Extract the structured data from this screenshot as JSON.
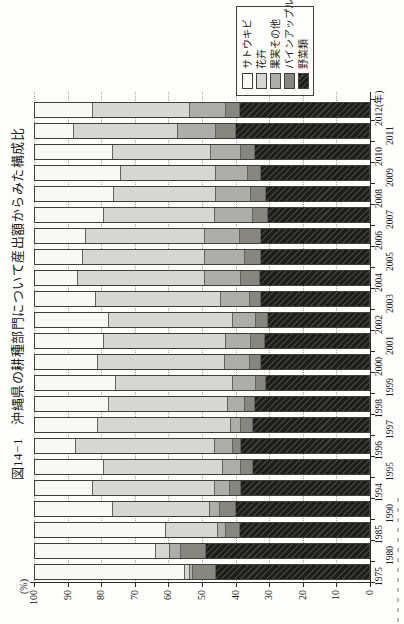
{
  "title": "図14−1　沖縄県の耕種部門について産出額からみた構成比",
  "axis": {
    "unit_label": "(%)",
    "y_ticks": [
      100,
      90,
      80,
      70,
      60,
      50,
      40,
      30,
      20,
      10,
      0
    ],
    "x_unit_suffix": "(年)"
  },
  "legend": {
    "items": [
      {
        "label": "サトウキビ",
        "color": "#f8f8f6"
      },
      {
        "label": "花卉",
        "color": "#d6d6d2"
      },
      {
        "label": "果実その他",
        "color": "#adada9"
      },
      {
        "label": "パインアップル",
        "color": "#87877f"
      },
      {
        "label": "野菜類",
        "color": "#1d1d1b"
      }
    ]
  },
  "chart_data": {
    "type": "bar",
    "stacked": true,
    "unit": "%",
    "orientation": "page rotated 90deg CCW (landscape chart on portrait page)",
    "title": "図14−1　沖縄県の耕種部門について産出額からみた構成比",
    "ylabel": "(%)",
    "ylim": [
      0,
      100
    ],
    "grid": "dotted horizontal line every 10%",
    "legend_position": "right-middle, boxed",
    "categories": [
      "1975",
      "1980",
      "1985",
      "1990",
      "1994",
      "1995",
      "1996",
      "1997",
      "1998",
      "1999",
      "2000",
      "2001",
      "2002",
      "2003",
      "2004",
      "2005",
      "2006",
      "2007",
      "2008",
      "2009",
      "2010",
      "2011",
      "2012"
    ],
    "series": [
      {
        "name": "サトウキビ",
        "values": [
          44.5,
          36.0,
          39.0,
          23.0,
          17.0,
          20.5,
          12.0,
          18.5,
          22.0,
          24.0,
          18.5,
          20.5,
          22.0,
          18.0,
          12.5,
          14.0,
          15.0,
          20.5,
          23.5,
          25.5,
          23.0,
          11.5,
          17.0
        ]
      },
      {
        "name": "花卉",
        "values": [
          1.5,
          4.0,
          15.5,
          29.0,
          36.5,
          35.5,
          41.5,
          40.0,
          35.5,
          35.0,
          38.0,
          36.5,
          37.0,
          37.5,
          38.0,
          36.5,
          35.5,
          33.0,
          30.5,
          28.5,
          29.5,
          31.0,
          29.0
        ]
      },
      {
        "name": "果実その他",
        "values": [
          1.0,
          3.5,
          2.5,
          3.0,
          4.5,
          5.5,
          5.5,
          3.0,
          5.0,
          7.0,
          7.5,
          7.5,
          7.0,
          8.5,
          11.0,
          12.0,
          10.5,
          11.5,
          10.5,
          9.5,
          9.0,
          11.5,
          11.0
        ]
      },
      {
        "name": "パインアップル",
        "values": [
          7.0,
          7.5,
          4.0,
          5.0,
          3.5,
          3.5,
          2.5,
          3.5,
          3.0,
          3.0,
          3.5,
          4.0,
          3.5,
          3.5,
          5.5,
          5.0,
          6.5,
          4.5,
          4.5,
          4.0,
          4.0,
          6.0,
          4.0
        ]
      },
      {
        "name": "野菜類",
        "values": [
          46.0,
          49.0,
          39.0,
          40.0,
          38.5,
          35.0,
          38.5,
          35.0,
          34.5,
          31.0,
          32.5,
          31.5,
          30.5,
          32.5,
          33.0,
          32.5,
          32.5,
          30.5,
          31.0,
          32.5,
          34.5,
          40.0,
          39.0
        ]
      }
    ]
  }
}
